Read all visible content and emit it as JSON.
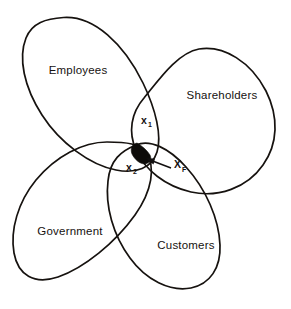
{
  "diagram": {
    "type": "venn-four-set",
    "title": "",
    "background_color": "#ffffff",
    "stroke_color": "#16120f",
    "core_fill_color": "#0d0b09",
    "sets": [
      {
        "id": "employees",
        "label": "Employees",
        "label_x": 78,
        "label_y": 74,
        "position": "upper-left"
      },
      {
        "id": "shareholders",
        "label": "Shareholders",
        "label_x": 222,
        "label_y": 99,
        "position": "upper-right"
      },
      {
        "id": "government",
        "label": "Government",
        "label_x": 70,
        "label_y": 235,
        "position": "lower-left"
      },
      {
        "id": "customers",
        "label": "Customers",
        "label_x": 186,
        "label_y": 249,
        "position": "lower-right"
      }
    ],
    "regions": [
      {
        "id": "x1",
        "base": "x",
        "subscript": "1",
        "x": 145,
        "y": 124,
        "description": "intersection of Employees and Shareholders"
      },
      {
        "id": "x2",
        "base": "x",
        "subscript": "2",
        "x": 130,
        "y": 171,
        "description": "intersection of Employees and Government"
      },
      {
        "id": "xf",
        "base": "X",
        "subscript": "F",
        "x": 176,
        "y": 170,
        "description": "feasible core - intersection of all four sets",
        "has_leader_arrow": true,
        "arrow_from_x": 171,
        "arrow_from_y": 168,
        "arrow_to_x": 148,
        "arrow_to_y": 160
      }
    ],
    "core": {
      "id": "feasible-core",
      "filled": true,
      "center_x": 142,
      "center_y": 155
    }
  }
}
